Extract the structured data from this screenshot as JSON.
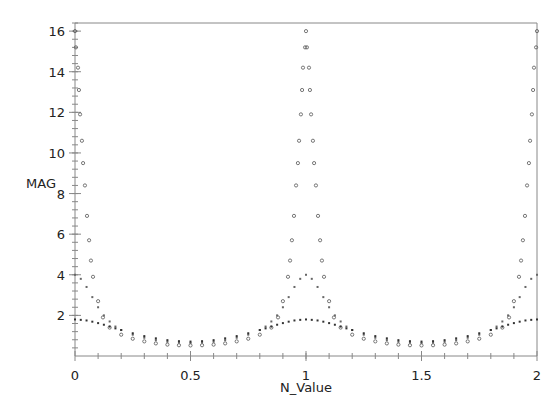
{
  "chart_data": {
    "type": "scatter",
    "title": "",
    "xlabel": "N_Value",
    "ylabel": "MAG",
    "xlim": [
      0,
      2
    ],
    "ylim": [
      0,
      16.4
    ],
    "grid": false,
    "legend": null,
    "x_ticks": [
      0,
      0.5,
      1,
      1.5,
      2
    ],
    "x_tick_labels": [
      "0",
      "0.5",
      "1",
      "1.5",
      "2"
    ],
    "y_ticks": [
      2,
      4,
      6,
      8,
      10,
      12,
      14,
      16
    ],
    "y_tick_labels": [
      "2",
      "4",
      "6",
      "8",
      "10",
      "12",
      "14",
      "16"
    ],
    "series": [
      {
        "name": "series-peak-16",
        "marker": "open-circle",
        "color": "#555555",
        "x": [
          0,
          0.004,
          0.013,
          0.017,
          0.022,
          0.03,
          0.035,
          0.043,
          0.052,
          0.061,
          0.069,
          0.078,
          0.1,
          0.121,
          0.15,
          0.2,
          0.25,
          0.3,
          0.35,
          0.4,
          0.45,
          0.5,
          0.55,
          0.6,
          0.65,
          0.7,
          0.75,
          0.8,
          0.85,
          0.879,
          0.9,
          0.922,
          0.931,
          0.939,
          0.948,
          0.957,
          0.965,
          0.97,
          0.978,
          0.983,
          0.987,
          0.996,
          1,
          1.004,
          1.013,
          1.017,
          1.022,
          1.03,
          1.035,
          1.043,
          1.052,
          1.061,
          1.069,
          1.078,
          1.1,
          1.121,
          1.15,
          1.2,
          1.25,
          1.3,
          1.35,
          1.4,
          1.45,
          1.5,
          1.55,
          1.6,
          1.65,
          1.7,
          1.75,
          1.8,
          1.85,
          1.879,
          1.9,
          1.922,
          1.931,
          1.939,
          1.948,
          1.957,
          1.965,
          1.97,
          1.978,
          1.983,
          1.987,
          1.996,
          2
        ],
        "y": [
          16,
          15.2,
          14.2,
          13.1,
          11.9,
          10.6,
          9.5,
          8.4,
          6.9,
          5.7,
          4.7,
          3.9,
          2.7,
          1.9,
          1.4,
          1.05,
          0.85,
          0.72,
          0.62,
          0.56,
          0.53,
          0.52,
          0.53,
          0.56,
          0.62,
          0.72,
          0.85,
          1.05,
          1.4,
          1.9,
          2.7,
          3.9,
          4.7,
          5.7,
          6.9,
          8.4,
          9.5,
          10.6,
          11.9,
          13.1,
          14.2,
          15.2,
          16,
          15.2,
          14.2,
          13.1,
          11.9,
          10.6,
          9.5,
          8.4,
          6.9,
          5.7,
          4.7,
          3.9,
          2.7,
          1.9,
          1.4,
          1.05,
          0.85,
          0.72,
          0.62,
          0.56,
          0.53,
          0.52,
          0.53,
          0.56,
          0.62,
          0.72,
          0.85,
          1.05,
          1.4,
          1.9,
          2.7,
          3.9,
          4.7,
          5.7,
          6.9,
          8.4,
          9.5,
          10.6,
          11.9,
          13.1,
          14.2,
          15.2,
          16
        ]
      },
      {
        "name": "series-peak-4",
        "marker": "small-dot",
        "color": "#666666",
        "x": [
          0,
          0.025,
          0.05,
          0.075,
          0.1,
          0.125,
          0.15,
          0.175,
          0.2,
          0.25,
          0.3,
          0.35,
          0.4,
          0.45,
          0.5,
          0.55,
          0.6,
          0.65,
          0.7,
          0.75,
          0.8,
          0.825,
          0.85,
          0.875,
          0.9,
          0.925,
          0.95,
          0.975,
          1,
          1.025,
          1.05,
          1.075,
          1.1,
          1.125,
          1.15,
          1.175,
          1.2,
          1.25,
          1.3,
          1.35,
          1.4,
          1.45,
          1.5,
          1.55,
          1.6,
          1.65,
          1.7,
          1.75,
          1.8,
          1.825,
          1.85,
          1.875,
          1.9,
          1.925,
          1.95,
          1.975,
          2
        ],
        "y": [
          4,
          3.8,
          3.4,
          2.9,
          2.4,
          2.0,
          1.7,
          1.45,
          1.28,
          1.05,
          0.9,
          0.78,
          0.7,
          0.66,
          0.64,
          0.66,
          0.7,
          0.78,
          0.9,
          1.05,
          1.28,
          1.45,
          1.7,
          2.0,
          2.4,
          2.9,
          3.4,
          3.8,
          4,
          3.8,
          3.4,
          2.9,
          2.4,
          2.0,
          1.7,
          1.45,
          1.28,
          1.05,
          0.9,
          0.78,
          0.7,
          0.66,
          0.64,
          0.66,
          0.7,
          0.78,
          0.9,
          1.05,
          1.28,
          1.45,
          1.7,
          2.0,
          2.4,
          2.9,
          3.4,
          3.8,
          4
        ]
      },
      {
        "name": "series-peak-1.8",
        "marker": "small-dot",
        "color": "#333333",
        "x": [
          0,
          0.025,
          0.05,
          0.075,
          0.1,
          0.125,
          0.15,
          0.175,
          0.2,
          0.25,
          0.3,
          0.35,
          0.4,
          0.45,
          0.5,
          0.55,
          0.6,
          0.65,
          0.7,
          0.75,
          0.8,
          0.825,
          0.85,
          0.875,
          0.9,
          0.925,
          0.95,
          0.975,
          1,
          1.025,
          1.05,
          1.075,
          1.1,
          1.125,
          1.15,
          1.175,
          1.2,
          1.25,
          1.3,
          1.35,
          1.4,
          1.45,
          1.5,
          1.55,
          1.6,
          1.65,
          1.7,
          1.75,
          1.8,
          1.825,
          1.85,
          1.875,
          1.9,
          1.925,
          1.95,
          1.975,
          2
        ],
        "y": [
          1.8,
          1.78,
          1.75,
          1.69,
          1.62,
          1.54,
          1.45,
          1.36,
          1.28,
          1.12,
          0.98,
          0.87,
          0.78,
          0.73,
          0.71,
          0.73,
          0.78,
          0.87,
          0.98,
          1.12,
          1.28,
          1.36,
          1.45,
          1.54,
          1.62,
          1.69,
          1.75,
          1.78,
          1.8,
          1.78,
          1.75,
          1.69,
          1.62,
          1.54,
          1.45,
          1.36,
          1.28,
          1.12,
          0.98,
          0.87,
          0.78,
          0.73,
          0.71,
          0.73,
          0.78,
          0.87,
          0.98,
          1.12,
          1.28,
          1.36,
          1.45,
          1.54,
          1.62,
          1.69,
          1.75,
          1.78,
          1.8
        ]
      }
    ]
  },
  "axes": {
    "x_title": "N_Value",
    "y_title": "MAG"
  },
  "colors": {
    "axis": "#888888",
    "text": "#222222",
    "background": "#ffffff"
  }
}
